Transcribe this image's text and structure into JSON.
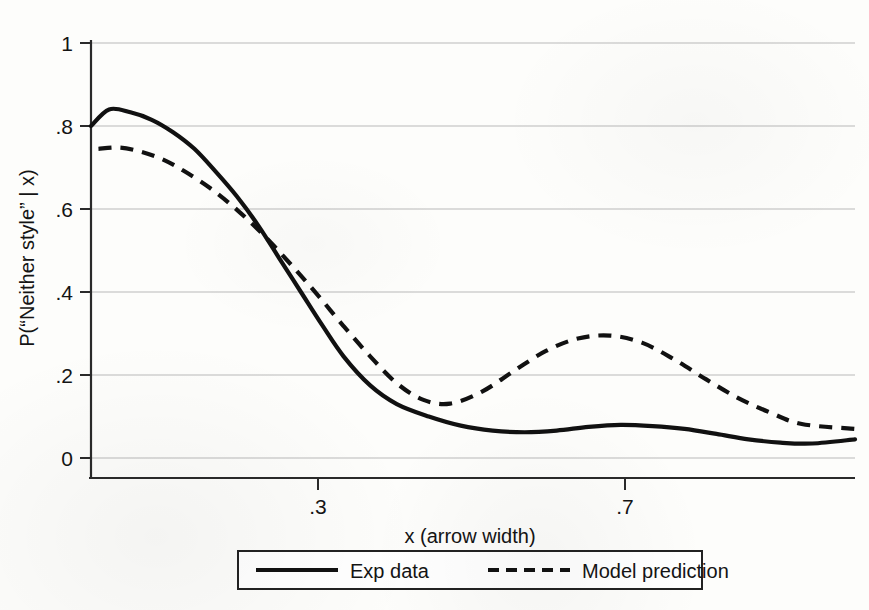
{
  "chart_data": {
    "type": "line",
    "title": "",
    "xlabel": "x (arrow width)",
    "ylabel": "P(“Neither style” | x)",
    "xlim": [
      0.283,
      1.0
    ],
    "ylim": [
      0.0,
      1.0
    ],
    "grid": true,
    "legend_position": "bottom-center",
    "xticks": [
      0.3,
      0.7
    ],
    "xticklabels": [
      ".3",
      ".7"
    ],
    "yticks": [
      0,
      0.2,
      0.4,
      0.6,
      0.8,
      1
    ],
    "yticklabels": [
      "0",
      ".2",
      ".4",
      ".6",
      ".8",
      "1"
    ],
    "series": [
      {
        "name": "Exp data",
        "style": "solid",
        "color": "#111111",
        "x": [
          0.283,
          0.3,
          0.32,
          0.34,
          0.36,
          0.38,
          0.4,
          0.42,
          0.44,
          0.46,
          0.48,
          0.5,
          0.52,
          0.545,
          0.57,
          0.6,
          0.63,
          0.66,
          0.69,
          0.72,
          0.75,
          0.78,
          0.81,
          0.84,
          0.87,
          0.9,
          0.93,
          0.96,
          1.0
        ],
        "y": [
          0.8,
          0.84,
          0.833,
          0.815,
          0.785,
          0.745,
          0.69,
          0.63,
          0.56,
          0.48,
          0.4,
          0.32,
          0.245,
          0.175,
          0.13,
          0.1,
          0.078,
          0.066,
          0.062,
          0.066,
          0.075,
          0.08,
          0.077,
          0.07,
          0.058,
          0.045,
          0.037,
          0.035,
          0.045
        ]
      },
      {
        "name": "Model prediction",
        "style": "dashed",
        "color": "#111111",
        "x": [
          0.29,
          0.31,
          0.33,
          0.35,
          0.37,
          0.395,
          0.42,
          0.445,
          0.47,
          0.495,
          0.52,
          0.545,
          0.57,
          0.595,
          0.62,
          0.65,
          0.68,
          0.71,
          0.74,
          0.77,
          0.8,
          0.83,
          0.86,
          0.89,
          0.92,
          0.95,
          1.0
        ],
        "y": [
          0.745,
          0.748,
          0.738,
          0.72,
          0.692,
          0.65,
          0.598,
          0.537,
          0.468,
          0.395,
          0.318,
          0.245,
          0.18,
          0.14,
          0.131,
          0.16,
          0.21,
          0.258,
          0.288,
          0.295,
          0.278,
          0.238,
          0.19,
          0.145,
          0.11,
          0.082,
          0.07
        ]
      }
    ]
  },
  "axes": {
    "ylabel_text": "P(“Neither style” | x)",
    "xlabel_text": "x (arrow width)",
    "y_ticks": [
      {
        "label": "1",
        "value": 1.0
      },
      {
        "label": ".8",
        "value": 0.8
      },
      {
        "label": ".6",
        "value": 0.6
      },
      {
        "label": ".4",
        "value": 0.4
      },
      {
        "label": ".2",
        "value": 0.2
      },
      {
        "label": "0",
        "value": 0.0
      }
    ],
    "x_ticks": [
      {
        "label": ".3",
        "value": 0.3
      },
      {
        "label": ".7",
        "value": 0.7
      }
    ]
  },
  "legend": {
    "entries": [
      {
        "label": "Exp data",
        "style": "solid"
      },
      {
        "label": "Model prediction",
        "style": "dashed"
      }
    ]
  },
  "colors": {
    "ink": "#111111",
    "grid": "#b9b9b9",
    "axis": "#2a2a2a",
    "background": "#fdfdfb"
  }
}
